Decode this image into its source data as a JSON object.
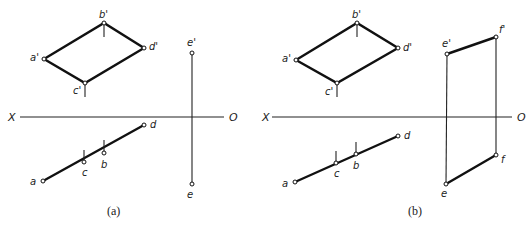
{
  "figure": {
    "panels": [
      {
        "caption": "(a)",
        "axis": {
          "left_label": "X",
          "right_label": "O"
        },
        "front_view_labels": {
          "a": "a'",
          "b": "b'",
          "c": "c'",
          "d": "d'",
          "e": "e'"
        },
        "top_view_labels": {
          "a": "a",
          "b": "b",
          "c": "c",
          "d": "d",
          "e": "e"
        }
      },
      {
        "caption": "(b)",
        "axis": {
          "left_label": "X",
          "right_label": "O"
        },
        "front_view_labels": {
          "a": "a'",
          "b": "b'",
          "c": "c'",
          "d": "d'",
          "e": "e'",
          "f": "f'"
        },
        "top_view_labels": {
          "a": "a",
          "b": "b",
          "c": "c",
          "d": "d",
          "e": "e",
          "f": "f"
        }
      }
    ]
  }
}
